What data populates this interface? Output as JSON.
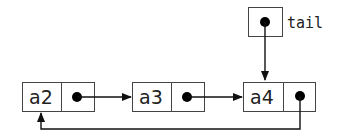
{
  "diagram": {
    "type": "circular linked list",
    "nodes": [
      {
        "id": "a2",
        "label": "a2",
        "next": "a3"
      },
      {
        "id": "a3",
        "label": "a3",
        "next": "a4"
      },
      {
        "id": "a4",
        "label": "a4",
        "next": "a2"
      }
    ],
    "pointer": {
      "label": "tail",
      "points_to": "a4"
    },
    "colors": {
      "stroke": "#444444",
      "arrow": "#111111",
      "text": "#222222",
      "background": "#ffffff"
    }
  }
}
